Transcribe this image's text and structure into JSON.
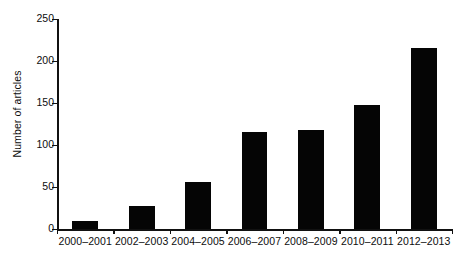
{
  "chart_data": {
    "type": "bar",
    "title": "",
    "subtitle": "",
    "xlabel": "",
    "ylabel": "Number of articles",
    "categories": [
      "2000–2001",
      "2002–2003",
      "2004–2005",
      "2006–2007",
      "2008–2009",
      "2010–2011",
      "2012–2013"
    ],
    "values": [
      9,
      27,
      56,
      115,
      118,
      148,
      215
    ],
    "ylim": [
      0,
      250
    ],
    "yticks": [
      0,
      50,
      100,
      150,
      200,
      250
    ],
    "ytick_labels": [
      "0",
      "50",
      "100",
      "150",
      "200",
      "250"
    ],
    "grid": false,
    "legend": null,
    "legend_position": "none",
    "bar_color": "#050505",
    "axis_color": "#111111",
    "background_color": "#ffffff",
    "annotations": []
  }
}
